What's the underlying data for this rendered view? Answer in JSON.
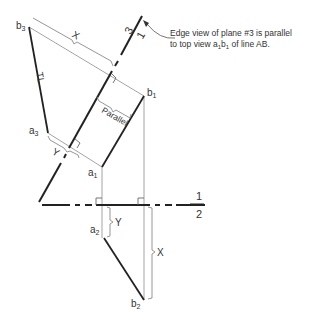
{
  "annotation": {
    "line1": "Edge view of plane #3 is parallel",
    "line2_prefix": "to top view a",
    "line2_sub1": "1",
    "line2_mid": "b",
    "line2_sub2": "1",
    "line2_suffix": " of line AB."
  },
  "fold_lines": {
    "fold_1_2": {
      "top": "1",
      "bottom": "2"
    },
    "fold_1_3": {
      "top": "3",
      "bottom": "1"
    }
  },
  "points": {
    "b3": {
      "letter": "b",
      "sub": "3"
    },
    "a3": {
      "letter": "a",
      "sub": "3"
    },
    "b1": {
      "letter": "b",
      "sub": "1"
    },
    "a1": {
      "letter": "a",
      "sub": "1"
    },
    "a2": {
      "letter": "a",
      "sub": "2"
    },
    "b2": {
      "letter": "b",
      "sub": "2"
    }
  },
  "dimension_labels": {
    "x_aux": "X",
    "y_aux": "Y",
    "x_front": "X",
    "y_front": "Y",
    "true_length": "TL",
    "parallel": "Parallel"
  },
  "colors": {
    "object_line": "#222222",
    "projection_line": "#9a9a9a",
    "text": "#333333"
  }
}
